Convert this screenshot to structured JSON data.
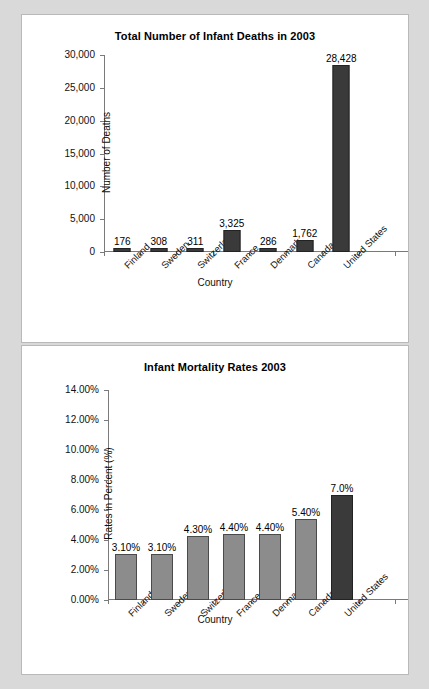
{
  "document": {
    "background_color": "#d9d9d9",
    "panel_background": "#ffffff"
  },
  "colors": {
    "bar_dark": "#3a3a3a",
    "bar_gray": "#8c8c8c",
    "axis": "#7a7a7a",
    "text": "#111111"
  },
  "charts": [
    {
      "id": "deaths",
      "title": "Total Number of Infant Deaths in 2003",
      "xlabel": "Country",
      "ylabel": "Number of Deaths",
      "yticks": [
        "30,000",
        "25,000",
        "20,000",
        "15,000",
        "10,000",
        "5,000",
        "0"
      ],
      "bars": [
        {
          "label": "Finland",
          "value_text": "176"
        },
        {
          "label": "Sweden",
          "value_text": "308"
        },
        {
          "label": "Switzerland",
          "value_text": "311"
        },
        {
          "label": "France",
          "value_text": "3,325"
        },
        {
          "label": "Denmark",
          "value_text": "286"
        },
        {
          "label": "Canada",
          "value_text": "1,762"
        },
        {
          "label": "United States",
          "value_text": "28,428"
        }
      ]
    },
    {
      "id": "rates",
      "title": "Infant Mortality Rates 2003",
      "xlabel": "Country",
      "ylabel": "Rates in Percent (%)",
      "yticks": [
        "14.00%",
        "12.00%",
        "10.00%",
        "8.00%",
        "6.00%",
        "4.00%",
        "2.00%",
        "0.00%"
      ],
      "bars": [
        {
          "label": "Finland",
          "value_text": "3.10%"
        },
        {
          "label": "Sweden",
          "value_text": "3.10%"
        },
        {
          "label": "Switzerland",
          "value_text": "4.30%"
        },
        {
          "label": "France",
          "value_text": "4.40%"
        },
        {
          "label": "Denmark",
          "value_text": "4.40%"
        },
        {
          "label": "Canada",
          "value_text": "5.40%"
        },
        {
          "label": "United States",
          "value_text": "7.0%"
        }
      ]
    }
  ],
  "chart_data": [
    {
      "type": "bar",
      "title": "Total Number of Infant Deaths in 2003",
      "xlabel": "Country",
      "ylabel": "Number of Deaths",
      "categories": [
        "Finland",
        "Sweden",
        "Switzerland",
        "France",
        "Denmark",
        "Canada",
        "United States"
      ],
      "values": [
        176,
        308,
        311,
        3325,
        286,
        1762,
        28428
      ],
      "data_labels": [
        "176",
        "308",
        "311",
        "3,325",
        "286",
        "1,762",
        "28,428"
      ],
      "ylim": [
        0,
        30000
      ],
      "ytick_values": [
        0,
        5000,
        10000,
        15000,
        20000,
        25000,
        30000
      ],
      "ytick_labels": [
        "0",
        "5,000",
        "10,000",
        "15,000",
        "20,000",
        "25,000",
        "30,000"
      ],
      "grid": false,
      "legend": false,
      "bar_colors": [
        "#3a3a3a",
        "#3a3a3a",
        "#3a3a3a",
        "#3a3a3a",
        "#3a3a3a",
        "#3a3a3a",
        "#3a3a3a"
      ],
      "notes": "Axis extends one empty category slot past United States; category labels rotated 45 degrees."
    },
    {
      "type": "bar",
      "title": "Infant Mortality Rates 2003",
      "xlabel": "Country",
      "ylabel": "Rates in Percent (%)",
      "categories": [
        "Finland",
        "Sweden",
        "Switzerland",
        "France",
        "Denmark",
        "Canada",
        "United States"
      ],
      "values": [
        3.1,
        3.1,
        4.3,
        4.4,
        4.4,
        5.4,
        7.0
      ],
      "data_labels": [
        "3.10%",
        "3.10%",
        "4.30%",
        "4.40%",
        "4.40%",
        "5.40%",
        "7.0%"
      ],
      "ylim": [
        0,
        14
      ],
      "ytick_values": [
        0,
        2,
        4,
        6,
        8,
        10,
        12,
        14
      ],
      "ytick_labels": [
        "0.00%",
        "2.00%",
        "4.00%",
        "6.00%",
        "8.00%",
        "10.00%",
        "12.00%",
        "14.00%"
      ],
      "grid": false,
      "legend": false,
      "bar_colors": [
        "#8c8c8c",
        "#8c8c8c",
        "#8c8c8c",
        "#8c8c8c",
        "#8c8c8c",
        "#8c8c8c",
        "#3a3a3a"
      ],
      "notes": "United States bar rendered darker than the others; axis extends one empty slot past United States."
    }
  ]
}
